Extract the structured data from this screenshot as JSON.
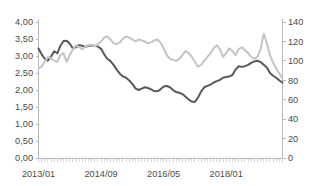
{
  "chart_data": {
    "type": "line",
    "title": "",
    "xlabel": "",
    "grid": false,
    "legend": "none",
    "x_tick_labels": [
      "2013/01",
      "2014/09",
      "2016/05",
      "2018/01"
    ],
    "x_tick_indices": [
      0,
      20,
      40,
      60
    ],
    "x_minor_tick_interval_months": 1,
    "x_range_start": "2013/01",
    "x_range_end": "2019/07",
    "n_points": 79,
    "axes": [
      {
        "id": "left",
        "position": "left",
        "ylim": [
          0.0,
          4.0
        ],
        "ylabel": "",
        "tick_labels": [
          "0,00",
          "0,50",
          "1,00",
          "1,50",
          "2,00",
          "2,50",
          "3,00",
          "3,50",
          "4,00"
        ],
        "tick_values": [
          0.0,
          0.5,
          1.0,
          1.5,
          2.0,
          2.5,
          3.0,
          3.5,
          4.0
        ],
        "decimal_separator": ","
      },
      {
        "id": "right",
        "position": "right",
        "ylim": [
          0,
          140
        ],
        "ylabel": "",
        "tick_labels": [
          "0",
          "20",
          "40",
          "60",
          "80",
          "100",
          "120",
          "140"
        ],
        "tick_values": [
          0,
          20,
          40,
          60,
          80,
          100,
          120,
          140
        ]
      }
    ],
    "series": [
      {
        "name": "dark-series",
        "axis": "left",
        "color": "#595959",
        "stroke_width": 2.0,
        "values": [
          3.22,
          3.05,
          2.92,
          2.86,
          2.98,
          3.14,
          3.08,
          3.3,
          3.44,
          3.45,
          3.36,
          3.22,
          3.26,
          3.32,
          3.3,
          3.27,
          3.3,
          3.31,
          3.3,
          3.28,
          3.21,
          3.05,
          2.92,
          2.85,
          2.74,
          2.6,
          2.48,
          2.4,
          2.36,
          2.28,
          2.18,
          2.05,
          2.0,
          2.04,
          2.08,
          2.06,
          2.02,
          1.97,
          1.96,
          2.02,
          2.1,
          2.12,
          2.08,
          2.0,
          1.94,
          1.92,
          1.88,
          1.8,
          1.72,
          1.66,
          1.65,
          1.78,
          1.96,
          2.08,
          2.12,
          2.16,
          2.22,
          2.26,
          2.3,
          2.36,
          2.38,
          2.4,
          2.44,
          2.6,
          2.7,
          2.68,
          2.7,
          2.74,
          2.8,
          2.84,
          2.86,
          2.82,
          2.74,
          2.66,
          2.5,
          2.42,
          2.36,
          2.28,
          2.22
        ]
      },
      {
        "name": "light-series",
        "axis": "right",
        "color": "#c4c4c4",
        "stroke_width": 2.0,
        "values": [
          92,
          94,
          99,
          104,
          103,
          100,
          99,
          106,
          108,
          99,
          106,
          112,
          116,
          114,
          112,
          115,
          116,
          116,
          115,
          117,
          120,
          124,
          125,
          122,
          118,
          117,
          119,
          123,
          125,
          124,
          122,
          120,
          122,
          121,
          120,
          118,
          119,
          121,
          122,
          119,
          113,
          106,
          102,
          101,
          100,
          102,
          106,
          110,
          108,
          104,
          99,
          94,
          96,
          100,
          104,
          108,
          113,
          116,
          112,
          104,
          108,
          113,
          110,
          106,
          112,
          114,
          111,
          108,
          104,
          102,
          104,
          112,
          128,
          118,
          106,
          98,
          92,
          87,
          82
        ]
      }
    ]
  }
}
